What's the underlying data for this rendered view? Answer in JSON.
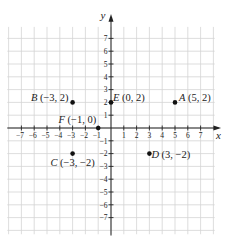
{
  "chart_data": {
    "type": "scatter",
    "title": "",
    "xlabel": "x",
    "ylabel": "y",
    "xlim": [
      -8,
      8
    ],
    "ylim": [
      -8,
      8
    ],
    "grid": true,
    "x_ticks": [
      -7,
      -6,
      -5,
      -4,
      -3,
      -2,
      -1,
      1,
      2,
      3,
      4,
      5,
      6,
      7
    ],
    "y_ticks": [
      7,
      6,
      5,
      4,
      3,
      2,
      1,
      -1,
      -2,
      -3,
      -4,
      -5,
      -6,
      -7
    ],
    "points": [
      {
        "name": "A",
        "x": 5,
        "y": 2,
        "label": "A (5, 2)"
      },
      {
        "name": "B",
        "x": -3,
        "y": 2,
        "label": "B (−3, 2)"
      },
      {
        "name": "C",
        "x": -3,
        "y": -2,
        "label": "C (−3, −2)"
      },
      {
        "name": "D",
        "x": 3,
        "y": -2,
        "label": "D (3, −2)"
      },
      {
        "name": "E",
        "x": 0,
        "y": 2,
        "label": "E (0, 2)"
      },
      {
        "name": "F",
        "x": -1,
        "y": 0,
        "label": "F (−1, 0)"
      }
    ]
  },
  "colors": {
    "grid": "#d4d4d4",
    "axis": "#222222",
    "point": "#111111",
    "background": "#ffffff"
  }
}
